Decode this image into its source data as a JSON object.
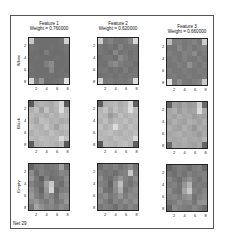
{
  "chart_data": {
    "type": "heatmap",
    "title": "",
    "footer": "Net 29",
    "columns": [
      {
        "title": "Feature 1",
        "subtitle": "Weight = 0.760000"
      },
      {
        "title": "Feature 2",
        "subtitle": "Weight = 0.620000"
      },
      {
        "title": "Feature 3",
        "subtitle": "Weight = 0.660000"
      }
    ],
    "rows": [
      "White",
      "Black",
      "Empty"
    ],
    "xticks": [
      "2",
      "4",
      "6",
      "8"
    ],
    "yticks": [
      "2",
      "4",
      "6",
      "8"
    ],
    "grid_size": [
      8,
      8
    ],
    "colormap": "gray",
    "panels": [
      [
        [
          [
            200,
            110,
            110,
            110,
            110,
            110,
            115,
            210
          ],
          [
            115,
            112,
            110,
            110,
            112,
            110,
            112,
            118
          ],
          [
            112,
            110,
            108,
            125,
            110,
            108,
            110,
            115
          ],
          [
            110,
            112,
            110,
            110,
            110,
            112,
            110,
            112
          ],
          [
            112,
            110,
            110,
            128,
            140,
            110,
            110,
            112
          ],
          [
            114,
            110,
            110,
            110,
            135,
            110,
            112,
            110
          ],
          [
            112,
            110,
            110,
            110,
            112,
            110,
            112,
            116
          ],
          [
            215,
            118,
            150,
            110,
            112,
            115,
            120,
            225
          ]
        ],
        [
          [
            205,
            120,
            130,
            118,
            115,
            120,
            135,
            215
          ],
          [
            120,
            112,
            118,
            110,
            130,
            115,
            118,
            120
          ],
          [
            118,
            115,
            110,
            135,
            115,
            120,
            112,
            118
          ],
          [
            112,
            118,
            120,
            112,
            138,
            125,
            115,
            120
          ],
          [
            115,
            112,
            130,
            140,
            125,
            118,
            120,
            112
          ],
          [
            118,
            120,
            112,
            118,
            112,
            125,
            112,
            118
          ],
          [
            112,
            115,
            118,
            112,
            118,
            115,
            120,
            118
          ],
          [
            210,
            120,
            125,
            118,
            120,
            118,
            125,
            220
          ]
        ],
        [
          [
            190,
            125,
            128,
            120,
            125,
            130,
            120,
            205
          ],
          [
            120,
            118,
            135,
            120,
            128,
            118,
            125,
            130
          ],
          [
            128,
            120,
            118,
            130,
            125,
            140,
            118,
            125
          ],
          [
            120,
            125,
            118,
            128,
            120,
            118,
            128,
            120
          ],
          [
            118,
            120,
            128,
            120,
            145,
            125,
            118,
            128
          ],
          [
            125,
            118,
            120,
            125,
            120,
            118,
            125,
            120
          ],
          [
            120,
            125,
            118,
            120,
            125,
            120,
            118,
            125
          ],
          [
            225,
            120,
            140,
            120,
            118,
            125,
            130,
            200
          ]
        ]
      ],
      [
        [
          [
            90,
            170,
            180,
            175,
            170,
            185,
            215,
            90
          ],
          [
            175,
            190,
            160,
            195,
            170,
            180,
            220,
            180
          ],
          [
            185,
            175,
            180,
            170,
            185,
            175,
            190,
            185
          ],
          [
            180,
            165,
            190,
            185,
            175,
            180,
            170,
            175
          ],
          [
            190,
            180,
            175,
            195,
            180,
            160,
            185,
            190
          ],
          [
            175,
            185,
            180,
            175,
            190,
            180,
            175,
            180
          ],
          [
            185,
            180,
            190,
            185,
            180,
            185,
            215,
            190
          ],
          [
            95,
            175,
            180,
            185,
            180,
            175,
            185,
            90
          ]
        ],
        [
          [
            95,
            175,
            180,
            185,
            170,
            180,
            215,
            95
          ],
          [
            180,
            195,
            170,
            190,
            175,
            185,
            220,
            185
          ],
          [
            185,
            180,
            155,
            170,
            190,
            175,
            185,
            180
          ],
          [
            175,
            190,
            170,
            185,
            180,
            190,
            175,
            185
          ],
          [
            190,
            175,
            185,
            220,
            185,
            175,
            190,
            180
          ],
          [
            180,
            185,
            190,
            180,
            175,
            185,
            180,
            190
          ],
          [
            185,
            180,
            175,
            190,
            185,
            180,
            185,
            215
          ],
          [
            90,
            185,
            180,
            175,
            185,
            190,
            180,
            95
          ]
        ],
        [
          [
            100,
            160,
            150,
            165,
            155,
            160,
            210,
            105
          ],
          [
            165,
            175,
            155,
            170,
            160,
            165,
            220,
            170
          ],
          [
            170,
            160,
            175,
            165,
            170,
            155,
            165,
            160
          ],
          [
            160,
            175,
            165,
            160,
            175,
            170,
            160,
            175
          ],
          [
            175,
            165,
            160,
            175,
            165,
            150,
            170,
            165
          ],
          [
            165,
            170,
            175,
            165,
            170,
            165,
            155,
            170
          ],
          [
            170,
            165,
            170,
            175,
            165,
            170,
            165,
            180
          ],
          [
            105,
            170,
            165,
            170,
            165,
            160,
            170,
            100
          ]
        ]
      ],
      [
        [
          [
            100,
            120,
            125,
            115,
            120,
            125,
            160,
            110
          ],
          [
            140,
            110,
            130,
            120,
            115,
            120,
            135,
            130
          ],
          [
            150,
            120,
            95,
            130,
            110,
            115,
            120,
            140
          ],
          [
            130,
            115,
            110,
            160,
            200,
            120,
            110,
            135
          ],
          [
            145,
            125,
            100,
            150,
            210,
            105,
            125,
            130
          ],
          [
            155,
            130,
            115,
            140,
            130,
            110,
            140,
            145
          ],
          [
            140,
            150,
            130,
            120,
            140,
            115,
            125,
            150
          ],
          [
            120,
            165,
            145,
            130,
            135,
            125,
            140,
            130
          ]
        ],
        [
          [
            110,
            125,
            120,
            130,
            115,
            125,
            140,
            115
          ],
          [
            125,
            115,
            120,
            110,
            125,
            130,
            200,
            125
          ],
          [
            140,
            120,
            110,
            130,
            150,
            130,
            120,
            140
          ],
          [
            130,
            125,
            100,
            145,
            190,
            125,
            115,
            130
          ],
          [
            145,
            115,
            110,
            140,
            175,
            115,
            130,
            140
          ],
          [
            130,
            140,
            120,
            130,
            150,
            125,
            140,
            135
          ],
          [
            140,
            125,
            110,
            135,
            125,
            140,
            130,
            145
          ],
          [
            120,
            130,
            125,
            110,
            130,
            120,
            135,
            125
          ]
        ],
        [
          [
            100,
            115,
            125,
            120,
            110,
            125,
            130,
            105
          ],
          [
            120,
            110,
            125,
            115,
            130,
            120,
            125,
            130
          ],
          [
            135,
            120,
            110,
            130,
            145,
            125,
            115,
            130
          ],
          [
            125,
            130,
            115,
            150,
            180,
            120,
            125,
            120
          ],
          [
            140,
            120,
            115,
            165,
            200,
            130,
            120,
            135
          ],
          [
            130,
            135,
            125,
            140,
            150,
            115,
            130,
            140
          ],
          [
            120,
            125,
            140,
            130,
            135,
            120,
            145,
            150
          ],
          [
            100,
            140,
            130,
            125,
            120,
            135,
            125,
            110
          ]
        ]
      ]
    ]
  }
}
